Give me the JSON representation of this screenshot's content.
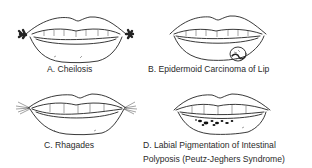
{
  "figure": {
    "panels": [
      {
        "id": "A",
        "caption": "A. Cheilosis",
        "icon": "lips-cheilosis-illustration"
      },
      {
        "id": "B",
        "caption": "B. Epidermoid Carcinoma of Lip",
        "icon": "lips-carcinoma-illustration"
      },
      {
        "id": "C",
        "caption": "C. Rhagades",
        "icon": "lips-rhagades-illustration"
      },
      {
        "id": "D",
        "caption_line1": "D. Labial Pigmentation of Intestinal",
        "caption_line2": "Polyposis (Peutz-Jeghers Syndrome)",
        "icon": "lips-pigmentation-illustration"
      }
    ]
  }
}
